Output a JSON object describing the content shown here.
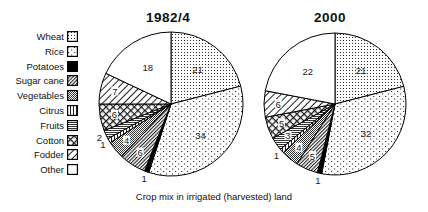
{
  "chart_data": [
    {
      "type": "pie",
      "title": "1982/4",
      "categories": [
        "Wheat",
        "Rice",
        "Potatoes",
        "Sugar cane",
        "Vegetables",
        "Citrus",
        "Fruits",
        "Cotton",
        "Fodder",
        "Other"
      ],
      "values": [
        21,
        34,
        1,
        6,
        4,
        1,
        2,
        6,
        7,
        18
      ],
      "unit": "% of irrigated (harvested) land",
      "start_angle": "12 o'clock, clockwise"
    },
    {
      "type": "pie",
      "title": "2000",
      "categories": [
        "Wheat",
        "Rice",
        "Potatoes",
        "Sugar cane",
        "Vegetables",
        "Citrus",
        "Fruits",
        "Cotton",
        "Fodder",
        "Other"
      ],
      "values": [
        21,
        32,
        1,
        5,
        4,
        1,
        3,
        5,
        6,
        22
      ],
      "unit": "% of irrigated (harvested) land",
      "start_angle": "12 o'clock, clockwise"
    }
  ],
  "caption": "Crop mix in irrigated (harvested) land",
  "titles": {
    "left": "1982/4",
    "right": "2000"
  },
  "legend": [
    {
      "label": "Wheat",
      "pattern": "dots-grid"
    },
    {
      "label": "Rice",
      "pattern": "dots-sparse"
    },
    {
      "label": "Potatoes",
      "pattern": "solid-black"
    },
    {
      "label": "Sugar cane",
      "pattern": "diagonal-dense"
    },
    {
      "label": "Vegetables",
      "pattern": "checker-dense"
    },
    {
      "label": "Citrus",
      "pattern": "vertical-lines"
    },
    {
      "label": "Fruits",
      "pattern": "horizontal-lines"
    },
    {
      "label": "Cotton",
      "pattern": "crosshatch-circles"
    },
    {
      "label": "Fodder",
      "pattern": "diagonal-sparse"
    },
    {
      "label": "Other",
      "pattern": "blank"
    }
  ]
}
